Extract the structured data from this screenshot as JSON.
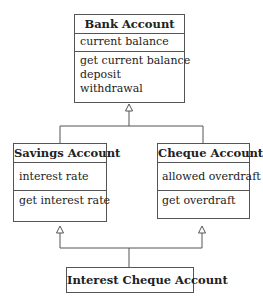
{
  "diagram": {
    "type": "uml-class-inheritance",
    "classes": [
      {
        "name": "Bank Account",
        "attributes": [
          "current balance"
        ],
        "operations": [
          "get current balance",
          "deposit",
          "withdrawal"
        ]
      },
      {
        "name": "Savings Account",
        "attributes": [
          "interest rate"
        ],
        "operations": [
          "get interest rate"
        ]
      },
      {
        "name": "Cheque Account",
        "attributes": [
          "allowed overdraft"
        ],
        "operations": [
          "get overdraft"
        ]
      },
      {
        "name": "Interest Cheque Account",
        "attributes": [],
        "operations": []
      }
    ],
    "relationships": [
      {
        "from": "Savings Account",
        "to": "Bank Account",
        "kind": "generalization"
      },
      {
        "from": "Cheque Account",
        "to": "Bank Account",
        "kind": "generalization"
      },
      {
        "from": "Interest Cheque Account",
        "to": "Savings Account",
        "kind": "generalization"
      },
      {
        "from": "Interest Cheque Account",
        "to": "Cheque Account",
        "kind": "generalization"
      }
    ],
    "colors": {
      "line": "#555555",
      "text": "#222222",
      "background": "#ffffff"
    }
  }
}
